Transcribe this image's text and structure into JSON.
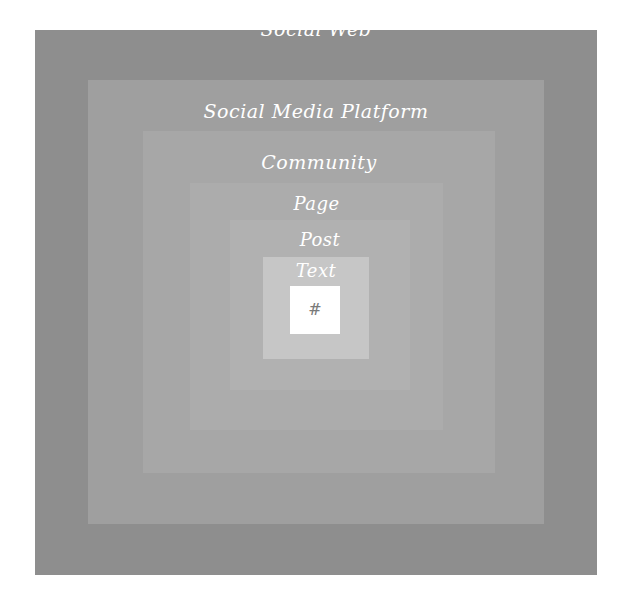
{
  "diagram": {
    "layers": [
      {
        "label": "Social Web",
        "color": "#8e8e8e"
      },
      {
        "label": "Social Media Platform",
        "color": "#9f9f9f"
      },
      {
        "label": "Community",
        "color": "#a7a7a7"
      },
      {
        "label": "Page",
        "color": "#acacac"
      },
      {
        "label": "Post",
        "color": "#b1b1b1"
      },
      {
        "label": "Text",
        "color": "#c6c6c6"
      },
      {
        "label": "#",
        "color": "#ffffff"
      }
    ]
  }
}
